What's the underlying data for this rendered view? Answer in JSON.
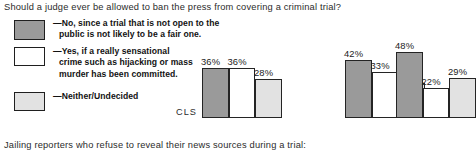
{
  "headings": {
    "top": "Should a judge ever be allowed to ban the press from covering a criminal trial?",
    "bottom": "Jailing reporters who refuse to reveal their news sources during a trial:"
  },
  "legend": {
    "items": [
      {
        "swatch": "dark-gray-swatch",
        "color": "#9a9a9a",
        "lines": [
          "—No, since a trial that is not open to the",
          "public is not likely to be a fair one."
        ]
      },
      {
        "swatch": "white-swatch",
        "color": "#ffffff",
        "lines": [
          "—Yes, if a really sensational",
          "crime such as hijacking or mass",
          "murder has been committed."
        ]
      },
      {
        "swatch": "light-gray-swatch",
        "color": "#e2e2e2",
        "lines": [
          "—Neither/Undecided"
        ]
      }
    ]
  },
  "chart_data": {
    "type": "bar",
    "title": "Should a judge ever be allowed to ban the press from covering a criminal trial?",
    "xlabel": "",
    "ylabel": "",
    "ylim": [
      0,
      55
    ],
    "grid": false,
    "legend_position": "left",
    "axis_label": "CLS",
    "categories": [
      "Group 1",
      "Group 2",
      "Group 3"
    ],
    "series": [
      {
        "name": "—No, since a trial that is not open to the public is not likely to be a fair one.",
        "color": "#9a9a9a",
        "values": [
          36,
          42,
          48
        ]
      },
      {
        "name": "—Yes, if a really sensational crime such as hijacking or mass murder has been committed.",
        "color": "#ffffff",
        "values": [
          36,
          33,
          22
        ]
      },
      {
        "name": "—Neither/Undecided",
        "color": "#e2e2e2",
        "values": [
          28,
          25,
          29
        ]
      }
    ],
    "data_labels": [
      [
        "36%",
        "36%",
        "28%"
      ],
      [
        "42%",
        "33%",
        "25%"
      ],
      [
        "48%",
        "22%",
        "29%"
      ]
    ]
  }
}
